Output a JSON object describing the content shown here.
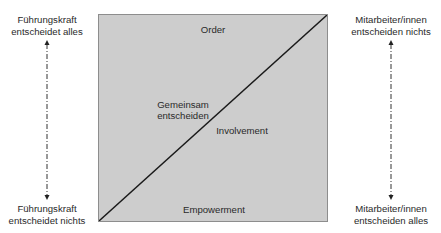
{
  "diagram": {
    "type": "quadrant-split",
    "box": {
      "fill": "#cdcdcd",
      "border": "#8d8d8d",
      "diagonal_color": "#1a1a1a",
      "labels": {
        "top": "Order",
        "middle_left_line1": "Gemeinsam",
        "middle_left_line2": "entscheiden",
        "middle_right": "Involvement",
        "bottom": "Empowerment"
      }
    },
    "left_axis": {
      "top_line1": "Führungskraft",
      "top_line2": "entscheidet alles",
      "bottom_line1": "Führungskraft",
      "bottom_line2": "entscheidet nichts",
      "arrow": "double-headed dash-dot vertical"
    },
    "right_axis": {
      "top_line1": "Mitarbeiter/innen",
      "top_line2": "entscheiden nichts",
      "bottom_line1": "Mitarbeiter/innen",
      "bottom_line2": "entscheiden alles",
      "arrow": "double-headed dash-dot vertical"
    }
  }
}
